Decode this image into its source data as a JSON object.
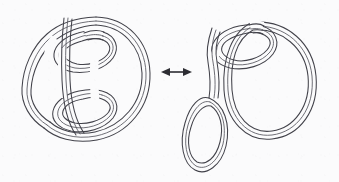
{
  "figure": {
    "domain": "diagram",
    "kind": "knot-band-isotopy-diagram",
    "caption": "",
    "background_color": "#fbfbfc",
    "stroke_color": "#42424a",
    "arrow_color": "#2d2d33",
    "canvas": {
      "width": 339,
      "height": 182
    },
    "panels": [
      {
        "id": "left",
        "name": "left-knot-diagram",
        "label": "",
        "bbox": [
          18,
          12,
          145,
          148
        ],
        "description": "Banded (ribbon) knot drawn as parallel triple lines: a large right-hand outer loop with two inner lobes crossing through a vertical band on the left side",
        "components": [
          {
            "name": "outer-large-loop",
            "type": "band-loop"
          },
          {
            "name": "upper-inner-lobe",
            "type": "band-loop"
          },
          {
            "name": "lower-inner-lobe",
            "type": "band-loop"
          },
          {
            "name": "left-side-band",
            "type": "band-arc"
          },
          {
            "name": "vertical-crossing-band",
            "type": "band-arc"
          }
        ],
        "crossings": 6
      },
      {
        "id": "right",
        "name": "right-knot-diagram",
        "label": "",
        "bbox": [
          190,
          12,
          140,
          160
        ],
        "description": "Equivalent banded knot after isotopy: large right oval band, upper small lobe crossing it, and a pendant small oval hanging from a stem at lower left",
        "components": [
          {
            "name": "outer-large-oval",
            "type": "band-loop"
          },
          {
            "name": "upper-small-lobe",
            "type": "band-loop"
          },
          {
            "name": "pendant-stem",
            "type": "band-arc"
          },
          {
            "name": "pendant-small-oval",
            "type": "band-loop"
          }
        ],
        "crossings": 4
      }
    ],
    "arrow": {
      "name": "double-headed-equivalence-arrow",
      "label": "",
      "type": "double-headed",
      "x1": 162,
      "x2": 190,
      "y": 72,
      "meaning": "isotopy equivalence between the two diagrams"
    }
  }
}
